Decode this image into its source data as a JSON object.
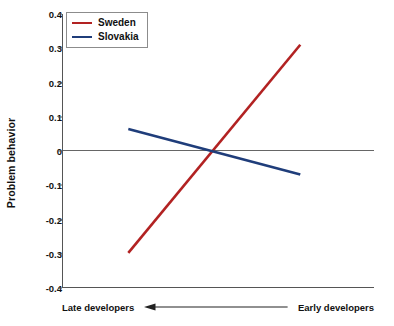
{
  "chart_data": {
    "type": "line",
    "title": "",
    "xlabel": "",
    "ylabel": "Problem behavior",
    "ylim": [
      -0.4,
      0.4
    ],
    "xlim": [
      0,
      1
    ],
    "grid": false,
    "legend_position": "top-left",
    "ytick_labels": [
      "0.4",
      "0.3",
      "0.2",
      "0.1",
      "0",
      "-0.1",
      "-0.2",
      "-0.3",
      "-0.4"
    ],
    "ytick_values": [
      0.4,
      0.3,
      0.2,
      0.1,
      0,
      -0.1,
      -0.2,
      -0.3,
      -0.4
    ],
    "zero_line": 0,
    "x_axis_annotation": {
      "left_label": "Late developers",
      "right_label": "Early developers",
      "arrow_direction": "left"
    },
    "series": [
      {
        "name": "Sweden",
        "color": "#b22222",
        "x": [
          0.21,
          0.763
        ],
        "values": [
          -0.3,
          0.31
        ]
      },
      {
        "name": "Slovakia",
        "color": "#1f3d7a",
        "x": [
          0.21,
          0.763
        ],
        "values": [
          0.063,
          -0.07
        ]
      }
    ]
  },
  "legend": {
    "items": [
      {
        "label": "Sweden",
        "color": "#b22222"
      },
      {
        "label": "Slovakia",
        "color": "#1f3d7a"
      }
    ]
  },
  "axes": {
    "y_title": "Problem behavior"
  },
  "colors": {
    "sweden": "#b22222",
    "slovakia": "#1f3d7a",
    "axis": "#555555",
    "text": "#111111",
    "background": "#ffffff"
  }
}
